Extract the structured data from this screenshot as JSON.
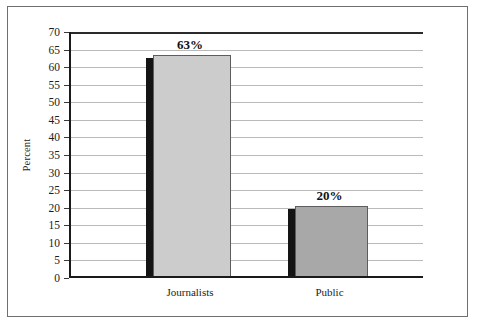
{
  "chart_data": {
    "type": "bar",
    "title": "",
    "subtitle": "",
    "xlabel": "",
    "ylabel": "Percent",
    "categories": [
      "Journalists",
      "Public"
    ],
    "values": [
      63,
      20
    ],
    "value_labels": [
      "63%",
      "20%"
    ],
    "ylim": [
      0,
      70
    ],
    "ytick_step": 5,
    "yticks": [
      0,
      5,
      10,
      15,
      20,
      25,
      30,
      35,
      40,
      45,
      50,
      55,
      60,
      65,
      70
    ],
    "ytick_labels": [
      "0",
      "5",
      "10",
      "15",
      "20",
      "25",
      "30",
      "35",
      "40",
      "45",
      "50",
      "55",
      "60",
      "65",
      "70"
    ],
    "grid": true,
    "grid_axis": "y",
    "legend": false,
    "legend_position": "none",
    "series": [
      {
        "name": "Percent",
        "values": [
          63,
          20
        ],
        "colors": [
          "#cccccc",
          "#a8a8a8"
        ]
      }
    ],
    "colors": {
      "bar_journalists": "#cccccc",
      "bar_public": "#a8a8a8",
      "bar_shadow": "#141414",
      "bar_outline": "#5d5d5d",
      "gridline": "#b9b9b9",
      "axis": "#1a1a1a",
      "frame": "#6f6f6f",
      "background": "#ffffff",
      "text": "#1c1c1c"
    }
  }
}
